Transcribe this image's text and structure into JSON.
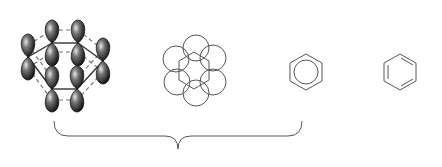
{
  "figure": {
    "title": "Benzene representations",
    "panels": [
      {
        "id": "p-orbitals",
        "description": "Six p-orbitals on hexagonal carbon ring"
      },
      {
        "id": "overlap-circles",
        "description": "Hexagon with six overlapping circles"
      },
      {
        "id": "circle-in-hexagon",
        "description": "Hexagon with inscribed circle"
      },
      {
        "id": "kekule",
        "description": "Kekulé structure with alternating double bonds"
      }
    ],
    "brace": {
      "spans": [
        "p-orbitals",
        "overlap-circles",
        "circle-in-hexagon"
      ]
    },
    "colors": {
      "line": "#555555",
      "orbital_dark": "#1a1a1a",
      "orbital_light": "#cccccc",
      "dash": "#777777"
    }
  }
}
